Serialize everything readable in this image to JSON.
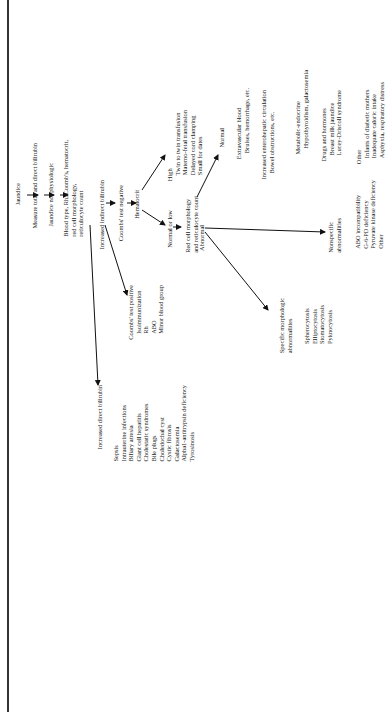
{
  "diagram": {
    "root": "Jaundice",
    "step1": "Measure total and direct bilirubin",
    "step2": "Jaundice not physiologic",
    "step3": [
      "Blood type, Rh, Coomb's, hematocrit,",
      "red cell morphology,",
      "reticulocyte count"
    ],
    "indirect": "Increased indirect bilirubin",
    "coombs_neg": "Coombs' test negative",
    "hematocrit": "Hematocrit",
    "high": {
      "label": "High",
      "items": [
        "Twin to twin transfusion",
        "Materno-fetal transfusion",
        "Delayed cord clamping",
        "Small for dates"
      ]
    },
    "normal_low": "Normal or low",
    "rbc_morph": [
      "Red cell morphology",
      "and reticulocyte count"
    ],
    "normal": {
      "label": "Normal",
      "groups": [
        {
          "title": "Extravascular blood",
          "items": [
            "Bruises, hemorrhage, etc."
          ]
        },
        {
          "title": "Increased enterohepatic circulation",
          "items": [
            "Bowel obstructions, etc."
          ]
        },
        {
          "title": "Metabolic-endocrine",
          "items": [
            "Hypothyroidism, galactosemia"
          ]
        },
        {
          "title": "Drugs and hormones",
          "items": [
            "Breast milk jaundice",
            "Lucey-Driscoll syndrome"
          ]
        },
        {
          "title": "Other",
          "items": [
            "Infants of diabetic mothers",
            "Inadequate caloric intake",
            "Asphyxia, respiratory distress"
          ]
        }
      ]
    },
    "abnormal": "Abnormal",
    "nonspecific": {
      "label": [
        "Nonspecific",
        "abnormalities"
      ],
      "items": [
        "ABO incompatibility",
        "G-6-PD deficiency",
        "Pyruvate kinase deficiency",
        "Other"
      ]
    },
    "specific": {
      "label": [
        "Specific morphologic",
        "abnormalities"
      ],
      "items": [
        "Spherocytosis",
        "Elliptocytosis",
        "Stomatocytosis",
        "Pyknocytosis"
      ]
    },
    "coombs_pos": {
      "label": "Coombs' test positive",
      "sub": "Isoimmunization",
      "items": [
        "Rh",
        "ABO",
        "Minor blood group"
      ]
    },
    "direct": {
      "label": "Increased direct bilirubin",
      "items": [
        "Sepsis",
        "Intrauterine infections",
        "Biliary atresia",
        "Giant cell hepatitis",
        "Cholestatic syndromes",
        "Bile plugs",
        "Choledochal cyst",
        "Cystic fibrosis",
        "Galactosemia",
        "Alpha1-antitrypsin deficiency",
        "Tyrosinosis"
      ]
    }
  }
}
